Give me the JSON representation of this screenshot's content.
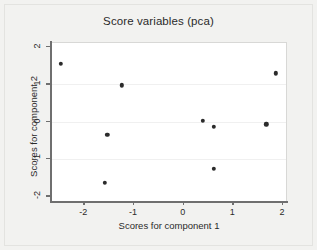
{
  "chart_data": {
    "type": "scatter",
    "title": "Score variables (pca)",
    "xlabel": "Scores for component 1",
    "ylabel": "Scores for component 2",
    "xlim": [
      -2.65,
      2.1
    ],
    "ylim": [
      -2.15,
      2.1
    ],
    "xticks": [
      -2,
      -1,
      0,
      1,
      2
    ],
    "xtick_labels": [
      "-2",
      "-1",
      "0",
      "1",
      "2"
    ],
    "yticks": [
      -2,
      -1,
      0,
      1,
      2
    ],
    "ytick_labels": [
      "-2",
      "-1",
      "0",
      "1",
      "2"
    ],
    "grid": false,
    "legend": null,
    "marker": {
      "shape": "circle",
      "color": "#2b2b2b",
      "size": 4.4
    },
    "points": [
      {
        "x": -2.45,
        "y": 1.52
      },
      {
        "x": -1.22,
        "y": 0.94
      },
      {
        "x": -1.52,
        "y": -0.38
      },
      {
        "x": -1.57,
        "y": -1.67
      },
      {
        "x": 0.41,
        "y": 0.0
      },
      {
        "x": 0.63,
        "y": -0.17
      },
      {
        "x": 0.63,
        "y": -1.29
      },
      {
        "x": 1.68,
        "y": -0.1
      },
      {
        "x": 1.88,
        "y": 1.26
      }
    ]
  },
  "figure": {
    "background_color": "#f2f2f0",
    "plot_background_color": "#ffffff",
    "axis_color": "#6f6f6f"
  }
}
